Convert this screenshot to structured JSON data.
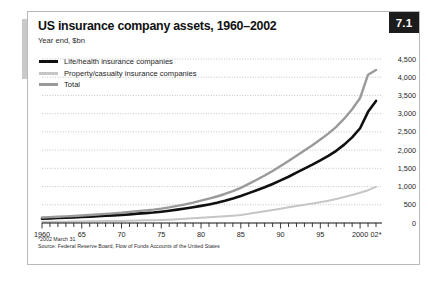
{
  "figure": {
    "number": "7.1",
    "title": "US insurance company assets, 1960–2002",
    "subtitle": "Year end, $bn",
    "footnote": "*2002 March 31",
    "source": "Source: Federal Reserve Board, Flow of Funds Accounts of the United States"
  },
  "colors": {
    "life_health": "#101010",
    "property_casualty": "#c6c6c6",
    "total": "#9a9a9a",
    "grid": "#b5b5b5",
    "axis": "#1a1a1a",
    "badge_bg": "#1c1c1c",
    "badge_text": "#ffffff",
    "frame": "#b9b9b9"
  },
  "legend": {
    "position": "top-left",
    "items": [
      {
        "label": "Life/health insurance companies",
        "color": "#101010",
        "width": 3.2
      },
      {
        "label": "Property/casualty insurance companies",
        "color": "#c6c6c6",
        "width": 2.6
      },
      {
        "label": "Total",
        "color": "#9a9a9a",
        "width": 3.0
      }
    ]
  },
  "chart_data": {
    "type": "line",
    "title": "US insurance company assets, 1960–2002",
    "subtitle": "Year end, $bn",
    "xlabel": "",
    "ylabel": "$bn",
    "grid": true,
    "xlim": [
      1960,
      2002
    ],
    "ylim": [
      0,
      4500
    ],
    "ytick_labels": [
      "4,500",
      "4,000",
      "3,500",
      "3,000",
      "2,500",
      "2,000",
      "1,500",
      "1,000",
      "500",
      "0"
    ],
    "yticks": [
      4500,
      4000,
      3500,
      3000,
      2500,
      2000,
      1500,
      1000,
      500,
      0
    ],
    "xtick_labels": [
      "1960",
      "65",
      "70",
      "75",
      "80",
      "85",
      "90",
      "95",
      "2000",
      "02*"
    ],
    "xticks": [
      1960,
      1965,
      1970,
      1975,
      1980,
      1985,
      1990,
      1995,
      2000,
      2002
    ],
    "x": [
      1960,
      1961,
      1962,
      1963,
      1964,
      1965,
      1966,
      1967,
      1968,
      1969,
      1970,
      1971,
      1972,
      1973,
      1974,
      1975,
      1976,
      1977,
      1978,
      1979,
      1980,
      1981,
      1982,
      1983,
      1984,
      1985,
      1986,
      1987,
      1988,
      1989,
      1990,
      1991,
      1992,
      1993,
      1994,
      1995,
      1996,
      1997,
      1998,
      1999,
      2000,
      2001,
      2002
    ],
    "series": [
      {
        "name": "Life/health insurance companies",
        "color": "#101010",
        "values": [
          120,
          128,
          136,
          145,
          155,
          165,
          175,
          186,
          198,
          210,
          222,
          238,
          256,
          272,
          288,
          310,
          336,
          366,
          398,
          432,
          470,
          510,
          555,
          610,
          672,
          740,
          820,
          900,
          980,
          1070,
          1170,
          1270,
          1380,
          1490,
          1600,
          1720,
          1840,
          1980,
          2150,
          2350,
          2600,
          3050,
          3350
        ]
      },
      {
        "name": "Property/casualty insurance companies",
        "color": "#c6c6c6",
        "values": [
          30,
          32,
          34,
          36,
          39,
          42,
          45,
          48,
          52,
          55,
          58,
          63,
          69,
          74,
          78,
          84,
          92,
          102,
          114,
          128,
          144,
          158,
          172,
          186,
          202,
          222,
          252,
          288,
          322,
          356,
          392,
          430,
          466,
          502,
          536,
          572,
          612,
          660,
          712,
          770,
          830,
          900,
          990
        ]
      },
      {
        "name": "Total",
        "color": "#9a9a9a",
        "values": [
          150,
          160,
          170,
          181,
          194,
          207,
          220,
          234,
          250,
          265,
          280,
          301,
          325,
          346,
          366,
          394,
          428,
          468,
          512,
          560,
          614,
          668,
          727,
          796,
          874,
          962,
          1072,
          1188,
          1302,
          1426,
          1562,
          1700,
          1846,
          1992,
          2136,
          2292,
          2452,
          2640,
          2862,
          3120,
          3430,
          4070,
          4200
        ]
      }
    ],
    "annotations": [
      {
        "text": "*2002 March 31"
      },
      {
        "text": "Source: Federal Reserve Board, Flow of Funds Accounts of the United States"
      }
    ]
  }
}
